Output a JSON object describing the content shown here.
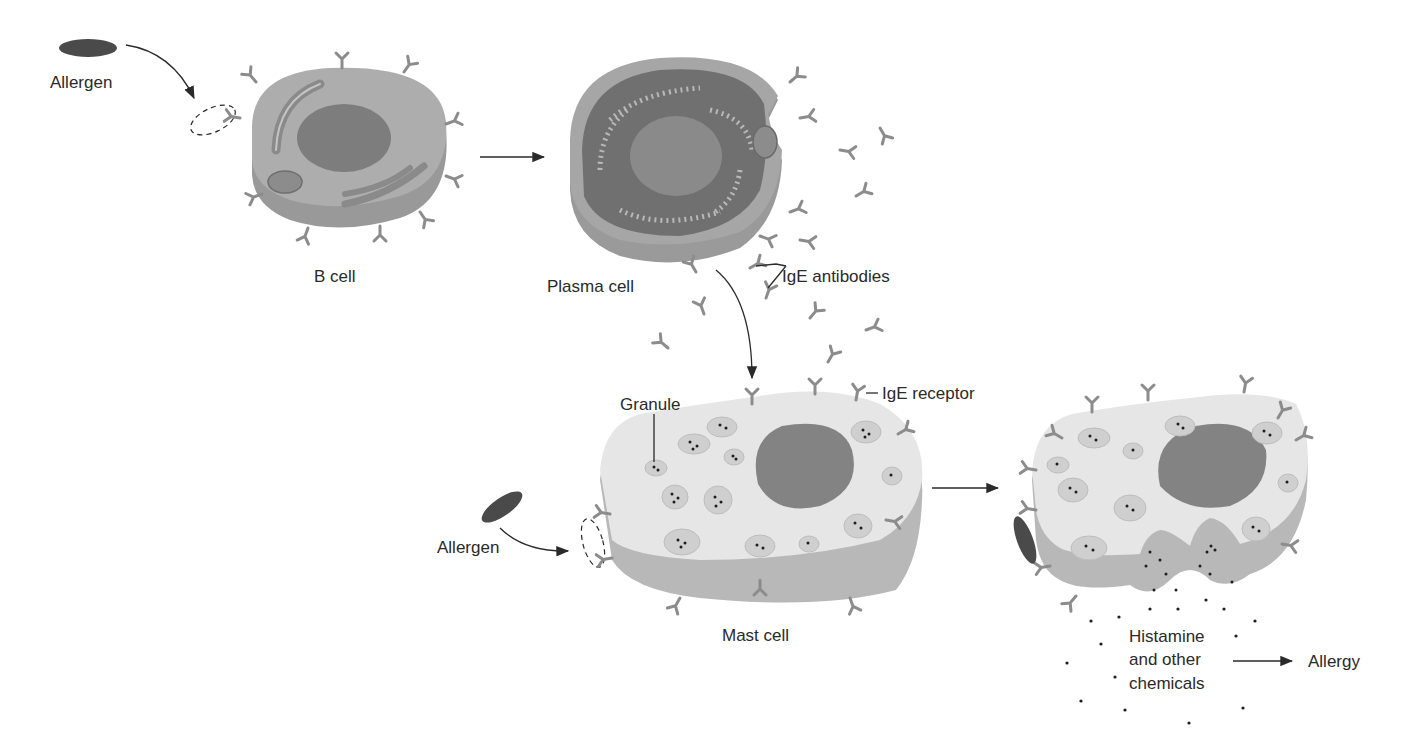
{
  "colors": {
    "background": "#ffffff",
    "cell_top_bcell": "#a9a9a9",
    "cell_side_bcell": "#9a9a9a",
    "nucleus": "#7a7a7a",
    "mast_top": "#e4e4e4",
    "mast_side": "#b9b9b9",
    "allergen": "#4a4a4a",
    "antibody": "#8c8c8c",
    "text": "#2a2a2a"
  },
  "labels": {
    "allergen_top": "Allergen",
    "b_cell": "B cell",
    "plasma_cell": "Plasma cell",
    "ige_antibodies": "IgE antibodies",
    "granule": "Granule",
    "ige_receptor": "IgE receptor",
    "allergen_bottom": "Allergen",
    "mast_cell": "Mast cell",
    "histamine_line1": "Histamine",
    "histamine_line2": "and other",
    "histamine_line3": "chemicals",
    "allergy": "Allergy"
  },
  "stages": [
    {
      "name": "Allergen encounters B cell",
      "order": 1
    },
    {
      "name": "B cell becomes Plasma cell",
      "order": 2
    },
    {
      "name": "Plasma cell releases IgE antibodies",
      "order": 3
    },
    {
      "name": "IgE binds to Mast cell IgE receptors",
      "order": 4
    },
    {
      "name": "Allergen binds to IgE on Mast cell",
      "order": 5
    },
    {
      "name": "Mast cell releases Histamine and other chemicals",
      "order": 6
    },
    {
      "name": "Allergy",
      "order": 7
    }
  ]
}
